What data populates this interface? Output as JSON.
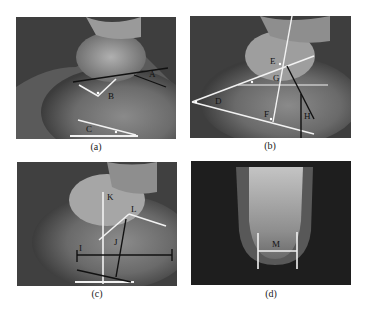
{
  "figure": {
    "panels": [
      {
        "id": "a",
        "caption": "(a)",
        "labels": [
          "A",
          "B",
          "C"
        ]
      },
      {
        "id": "b",
        "caption": "(b)",
        "labels": [
          "D",
          "E",
          "F",
          "G",
          "H"
        ]
      },
      {
        "id": "c",
        "caption": "(c)",
        "labels": [
          "I",
          "J",
          "K",
          "L"
        ]
      },
      {
        "id": "d",
        "caption": "(d)",
        "labels": [
          "M"
        ]
      }
    ]
  },
  "colors": {
    "background": "#ffffff",
    "xray_dark": "#3a3a3a",
    "bone_light": "#bdbdbd",
    "line_white": "#f2f2f2",
    "line_black": "#111111"
  }
}
